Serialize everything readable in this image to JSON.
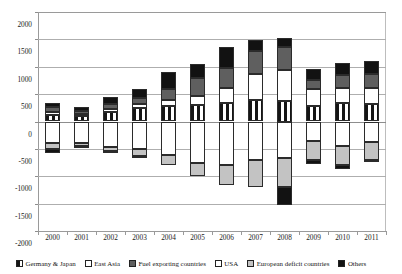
{
  "chart_data": {
    "type": "bar",
    "title": "",
    "xlabel": "",
    "ylabel": "",
    "ylim": [
      -2000,
      2000
    ],
    "yticks": [
      2000,
      1500,
      1000,
      500,
      0,
      -500,
      -1000,
      -1500,
      -2000
    ],
    "ytick_labels": [
      "2000",
      "1500",
      "1000",
      "500",
      "0",
      "-500",
      "-1000",
      "-1500",
      "-2000"
    ],
    "grid": true,
    "stacked": true,
    "legend_position": "bottom",
    "categories": [
      "2000",
      "2001",
      "2002",
      "2003",
      "2004",
      "2005",
      "2006",
      "2007",
      "2008",
      "2009",
      "2010",
      "2011"
    ],
    "series": [
      {
        "name": "Germany & Japan",
        "key": "germany",
        "color": "#ffffff",
        "values": [
          110,
          95,
          175,
          245,
          285,
          300,
          335,
          400,
          375,
          285,
          330,
          320
        ]
      },
      {
        "name": "East Asia",
        "key": "eastasia",
        "color": "#ffffff",
        "values": [
          55,
          40,
          60,
          80,
          105,
          170,
          280,
          470,
          560,
          300,
          290,
          285
        ]
      },
      {
        "name": "Fuel exporting countries",
        "key": "fuel",
        "color": "#5f5f5f",
        "values": [
          105,
          65,
          80,
          110,
          195,
          320,
          370,
          420,
          430,
          165,
          225,
          265
        ]
      },
      {
        "name": "USA",
        "key": "usa",
        "color": "#ffffff",
        "values": [
          -400,
          -395,
          -460,
          -500,
          -610,
          -760,
          -800,
          -710,
          -665,
          -355,
          -450,
          -370
        ]
      },
      {
        "name": "European deficit countries",
        "key": "eudef",
        "color": "#c3c3c3",
        "values": [
          -95,
          -55,
          -70,
          -135,
          -180,
          -235,
          -360,
          -480,
          -535,
          -355,
          -345,
          -340
        ]
      },
      {
        "name": "Others",
        "key": "others",
        "color": "#121212",
        "values": [
          [
            60,
            -75
          ],
          [
            70,
            -10
          ],
          [
            130,
            -5
          ],
          [
            155,
            -10
          ],
          [
            310,
            0
          ],
          [
            265,
            0
          ],
          [
            370,
            0
          ],
          [
            205,
            0
          ],
          [
            155,
            -330
          ],
          [
            205,
            -75
          ],
          [
            230,
            -65
          ],
          [
            230,
            -15
          ]
        ]
      }
    ]
  },
  "legend": {
    "items": [
      {
        "label": "Germany & Japan",
        "key": "germany"
      },
      {
        "label": "East Asia",
        "key": "eastasia"
      },
      {
        "label": "Fuel exporting countries",
        "key": "fuel"
      },
      {
        "label": "USA",
        "key": "usa"
      },
      {
        "label": "European deficit countries",
        "key": "eudef"
      },
      {
        "label": "Others",
        "key": "others"
      }
    ]
  },
  "colors": {
    "germany": "#ffffff",
    "eastasia": "#ffffff",
    "fuel": "#5f5f5f",
    "usa": "#ffffff",
    "eudef": "#c3c3c3",
    "others": "#121212",
    "grid": "#aeaeae",
    "axis": "#8d8d8d"
  }
}
